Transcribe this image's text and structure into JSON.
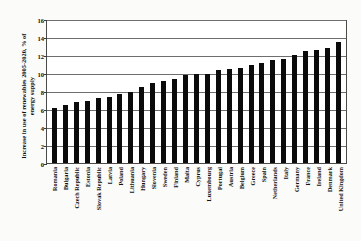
{
  "chart_data": {
    "type": "bar",
    "title": "",
    "xlabel": "",
    "ylabel": "Increase in use of renewables 2005-2020, % of energy supply",
    "ylabel_line1": "Increase in use of renewables 2005-2020, % of",
    "ylabel_line2": "energy supply",
    "ylim": [
      0,
      16
    ],
    "yticks": [
      0,
      2,
      4,
      6,
      8,
      10,
      12,
      14,
      16
    ],
    "grid": true,
    "legend": "none",
    "bar_color": "#0b0b0b",
    "categories": [
      "Romania",
      "Bulgaria",
      "Czech Republic",
      "Estonia",
      "Slovak Republic",
      "Latvia",
      "Poland",
      "Lithuania",
      "Hungary",
      "Slovenia",
      "Sweden",
      "Finland",
      "Malta",
      "Cyprus",
      "Luxembourg",
      "Portugal",
      "Austria",
      "Belgium",
      "Greece",
      "Spain",
      "Netherlands",
      "Italy",
      "Germany",
      "France",
      "Ireland",
      "Denmark",
      "United Kingdom"
    ],
    "values": [
      6.1,
      6.5,
      6.8,
      6.9,
      7.2,
      7.3,
      7.7,
      7.9,
      8.5,
      8.9,
      9.1,
      9.3,
      9.8,
      9.9,
      9.9,
      10.3,
      10.5,
      10.6,
      10.9,
      11.1,
      11.4,
      11.6,
      12.0,
      12.4,
      12.6,
      12.8,
      13.5
    ]
  }
}
